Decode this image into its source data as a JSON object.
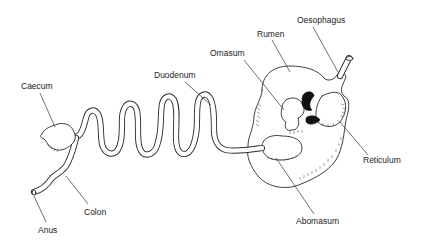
{
  "diagram": {
    "colors": {
      "line": "#2a2a2a",
      "fill": "#ffffff",
      "dark": "#111111",
      "text": "#222222"
    },
    "labels": {
      "oesophagus": "Oesophagus",
      "rumen": "Rumen",
      "omasum": "Omasum",
      "reticulum": "Reticulum",
      "abomasum": "Abomasum",
      "duodenum": "Duodenum",
      "caecum": "Caecum",
      "colon": "Colon",
      "anus": "Anus"
    }
  }
}
